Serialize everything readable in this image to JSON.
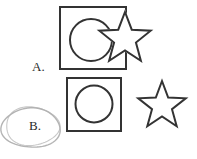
{
  "figure": {
    "width": 197,
    "height": 159,
    "background_color": "#ffffff",
    "stroke_color": "#333333",
    "stroke_width": 2,
    "annotation_color": "#b0b0b0",
    "annotation_width": 1.4,
    "label_color": "#2b2b2b"
  },
  "rows": [
    {
      "id": "row-a",
      "label": "A.",
      "label_x": 32,
      "label_y": 60,
      "annotated": false,
      "description": "square with inscribed circle, overlapped and partly occluded by a five-pointed star",
      "shapes": [
        {
          "name": "square",
          "type": "rect",
          "x": 60,
          "y": 7,
          "width": 66,
          "height": 62,
          "occluded": true
        },
        {
          "name": "circle",
          "type": "circle",
          "cx": 91,
          "cy": 40,
          "r": 21,
          "occluded": true
        },
        {
          "name": "star",
          "type": "star",
          "cx": 125,
          "cy": 39,
          "outer_r": 27,
          "inner_r": 11.5,
          "points": 5,
          "rotation": -90,
          "occluded": false,
          "on_top": true
        }
      ]
    },
    {
      "id": "row-b",
      "label": "B.",
      "label_x": 29,
      "label_y": 119,
      "annotated": true,
      "annotation": {
        "name": "hand-drawn-ellipse",
        "type": "ellipse-sketch",
        "cx": 31,
        "cy": 128,
        "rx": 29,
        "ry": 20,
        "strokes": 2,
        "style": "pencil"
      },
      "description": "square with inscribed circle, and a separate unoccluded five-pointed star",
      "shapes": [
        {
          "name": "square",
          "type": "rect",
          "x": 67,
          "y": 78,
          "width": 54,
          "height": 53,
          "occluded": false
        },
        {
          "name": "circle",
          "type": "circle",
          "cx": 94,
          "cy": 104,
          "r": 18.5,
          "occluded": false
        },
        {
          "name": "star",
          "type": "star",
          "cx": 162,
          "cy": 106,
          "outer_r": 25,
          "inner_r": 10.5,
          "points": 5,
          "rotation": -90,
          "occluded": false
        }
      ]
    }
  ]
}
